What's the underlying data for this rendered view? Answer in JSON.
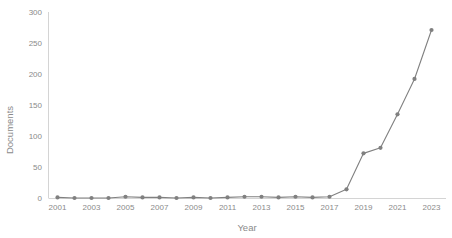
{
  "chart_data": {
    "type": "line",
    "title": "",
    "xlabel": "Year",
    "ylabel": "Documents",
    "x": [
      2001,
      2002,
      2003,
      2004,
      2005,
      2006,
      2007,
      2008,
      2009,
      2010,
      2011,
      2012,
      2013,
      2014,
      2015,
      2016,
      2017,
      2018,
      2019,
      2020,
      2021,
      2022,
      2023
    ],
    "values": [
      1,
      0,
      0,
      0,
      2,
      1,
      1,
      0,
      1,
      0,
      1,
      2,
      2,
      1,
      2,
      1,
      2,
      14,
      72,
      81,
      135,
      192,
      271
    ],
    "series": [
      {
        "name": "Documents",
        "values": [
          1,
          0,
          0,
          0,
          2,
          1,
          1,
          0,
          1,
          0,
          1,
          2,
          2,
          1,
          2,
          1,
          2,
          14,
          72,
          81,
          135,
          192,
          271
        ]
      }
    ],
    "xlim": [
      2000.5,
      2023.5
    ],
    "ylim": [
      0,
      300
    ],
    "yticks": [
      0,
      50,
      100,
      150,
      200,
      250,
      300
    ],
    "ytick_labels": [
      "0",
      "50",
      "100",
      "150",
      "200",
      "250",
      "300"
    ],
    "xticks": [
      2001,
      2003,
      2005,
      2007,
      2009,
      2011,
      2013,
      2015,
      2017,
      2019,
      2021,
      2023
    ],
    "xtick_labels": [
      "2001",
      "2003",
      "2005",
      "2007",
      "2009",
      "2011",
      "2013",
      "2015",
      "2017",
      "2019",
      "2021",
      "2023"
    ],
    "grid": false,
    "legend": false,
    "legend_position": "none",
    "colors": {
      "line": "#808080",
      "marker": "#808080",
      "axis": "#d4d4d4",
      "text": "#8a8a8a",
      "background": "#ffffff"
    },
    "marker": "circle"
  }
}
